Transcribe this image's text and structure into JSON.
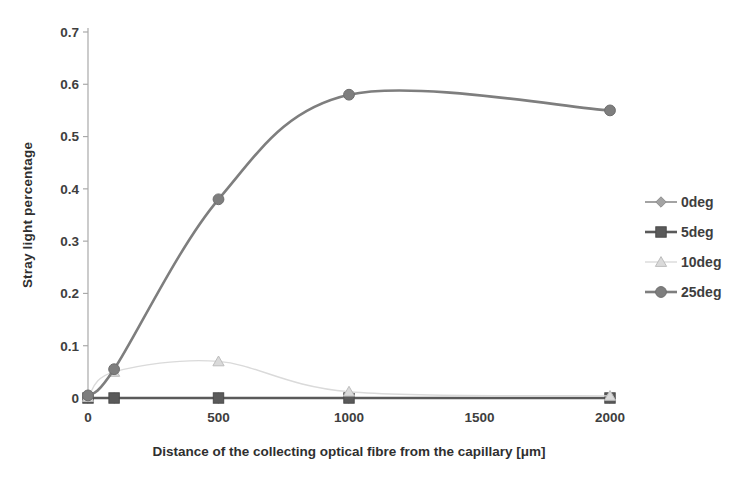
{
  "chart_data": {
    "type": "line",
    "title": "",
    "xlabel": "Distance of the collecting optical fibre from the capillary [μm]",
    "ylabel": "Stray light percentage",
    "x": [
      0,
      100,
      500,
      1000,
      2000
    ],
    "series": [
      {
        "name": "0deg",
        "marker": "diamond",
        "color": "#a3a3a3",
        "edge": "#8f8f8f",
        "line_width": 2.0,
        "values": [
          0,
          0,
          0,
          0,
          0
        ]
      },
      {
        "name": "5deg",
        "marker": "square",
        "color": "#5a5a5a",
        "edge": "#4a4a4a",
        "line_width": 2.6,
        "values": [
          0,
          0,
          0,
          0,
          0
        ]
      },
      {
        "name": "10deg",
        "marker": "triangle",
        "color": "#dadada",
        "edge": "#bdbdbd",
        "line_width": 1.4,
        "values": [
          0.002,
          0.05,
          0.07,
          0.012,
          0.004
        ]
      },
      {
        "name": "25deg",
        "marker": "circle",
        "color": "#7e7e7e",
        "edge": "#6e6e6e",
        "line_width": 2.6,
        "values": [
          0.005,
          0.055,
          0.38,
          0.58,
          0.55
        ]
      }
    ],
    "xlim": [
      0,
      2000
    ],
    "ylim": [
      0,
      0.7
    ],
    "xticks": [
      0,
      500,
      1000,
      1500,
      2000
    ],
    "ytick_step": 0.1,
    "grid": false,
    "legend_position": "right",
    "smooth": true,
    "axis_color": "#a9a9a9",
    "tick_label_color": "#3e3e3e"
  }
}
